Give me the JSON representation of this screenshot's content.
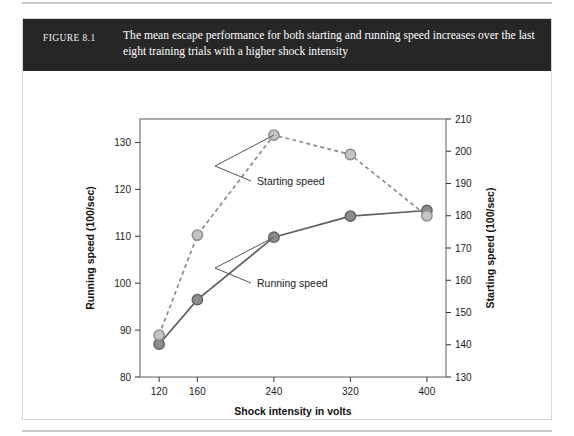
{
  "figure": {
    "number_label": "FIGURE 8.1",
    "caption": "The mean escape performance for both starting and running speed increases over the last eight training trials with a higher shock intensity"
  },
  "chart_data": {
    "type": "line",
    "title": "",
    "xlabel": "Shock intensity in volts",
    "ylabel": "Running speed (100/sec)",
    "y2label": "Starting speed (100/sec)",
    "x": [
      120,
      160,
      240,
      320,
      400
    ],
    "xtick_labels": [
      "120",
      "160",
      "240",
      "320",
      "400"
    ],
    "xlim": [
      100,
      420
    ],
    "ylim": [
      80,
      135
    ],
    "ytick_labels": [
      "80",
      "90",
      "100",
      "110",
      "120",
      "130"
    ],
    "yticks": [
      80,
      90,
      100,
      110,
      120,
      130
    ],
    "y2lim": [
      130,
      210
    ],
    "y2tick_labels": [
      "130",
      "140",
      "150",
      "160",
      "170",
      "180",
      "190",
      "200",
      "210"
    ],
    "y2ticks": [
      130,
      140,
      150,
      160,
      170,
      180,
      190,
      200,
      210
    ],
    "grid": false,
    "legend_position": "inline-annotations",
    "series": [
      {
        "name": "Running speed",
        "axis": "left",
        "linestyle": "solid",
        "color": "#5f5f5f",
        "marker_fill": "#8c8c8c",
        "values": [
          87.0,
          96.5,
          109.8,
          114.3,
          115.5
        ]
      },
      {
        "name": "Starting speed",
        "axis": "right",
        "linestyle": "dashed",
        "color": "#8a8a8a",
        "marker_fill": "#c4c4c4",
        "values": [
          143,
          174,
          205,
          199,
          180
        ]
      }
    ],
    "annotations": [
      {
        "text": "Starting speed",
        "x": 240,
        "y": 205
      },
      {
        "text": "Running speed",
        "x": 240,
        "y": 109.8
      }
    ]
  },
  "colors": {
    "caption_bar": "#262626",
    "frame": "#8a8a8a",
    "text": "#1a1a1a"
  }
}
